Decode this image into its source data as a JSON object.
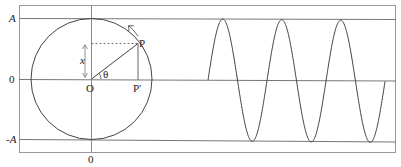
{
  "diagram": {
    "labels": {
      "y_top": "A",
      "y_zero": "0",
      "y_bottom": "-A",
      "x_zero": "0",
      "center": "O",
      "point": "P",
      "projection": "P′",
      "displacement": "x",
      "angle": "θ"
    },
    "colors": {
      "line": "#555555",
      "frame": "#999999",
      "curve": "#444444",
      "text": "#222222"
    }
  }
}
